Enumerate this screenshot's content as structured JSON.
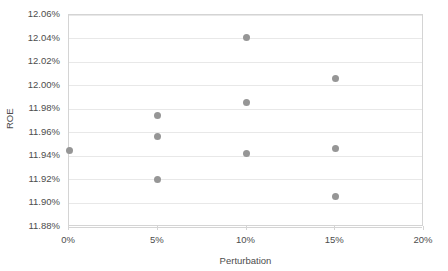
{
  "chart_data": {
    "type": "scatter",
    "title": "",
    "xlabel": "Perturbation",
    "ylabel": "ROE",
    "xlim": [
      0,
      20
    ],
    "ylim": [
      11.88,
      12.06
    ],
    "xtick_labels": [
      "0%",
      "5%",
      "10%",
      "15%",
      "20%"
    ],
    "xtick_values": [
      0,
      5,
      10,
      15,
      20
    ],
    "ytick_labels": [
      "11.88%",
      "11.90%",
      "11.92%",
      "11.94%",
      "11.96%",
      "11.98%",
      "12.00%",
      "12.02%",
      "12.04%",
      "12.06%"
    ],
    "ytick_values": [
      11.88,
      11.9,
      11.92,
      11.94,
      11.96,
      11.98,
      12.0,
      12.02,
      12.04,
      12.06
    ],
    "grid": "horizontal",
    "legend": "none",
    "marker_color": "#969696",
    "points": [
      {
        "x": 0,
        "y": 11.945
      },
      {
        "x": 5,
        "y": 11.975
      },
      {
        "x": 5,
        "y": 11.957
      },
      {
        "x": 5,
        "y": 11.92
      },
      {
        "x": 10,
        "y": 12.041
      },
      {
        "x": 10,
        "y": 11.986
      },
      {
        "x": 10,
        "y": 11.942
      },
      {
        "x": 15,
        "y": 12.006
      },
      {
        "x": 15,
        "y": 11.947
      },
      {
        "x": 15,
        "y": 11.906
      }
    ]
  }
}
